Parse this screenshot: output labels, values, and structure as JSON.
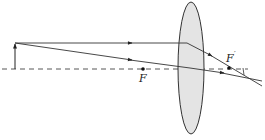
{
  "diagram": {
    "type": "ray-diagram-converging-lens",
    "labels": {
      "front_focus": "F",
      "back_focus": "F",
      "back_focus_prime": "′"
    },
    "colors": {
      "lens_fill": "#e4e4e4",
      "lens_stroke": "#333333",
      "ray": "#333333",
      "axis": "#444444"
    },
    "elements": [
      "object-arrow",
      "optical-axis",
      "lens",
      "ray-parallel",
      "ray-through-center",
      "front-focal-point",
      "back-focal-point",
      "image-point"
    ]
  }
}
